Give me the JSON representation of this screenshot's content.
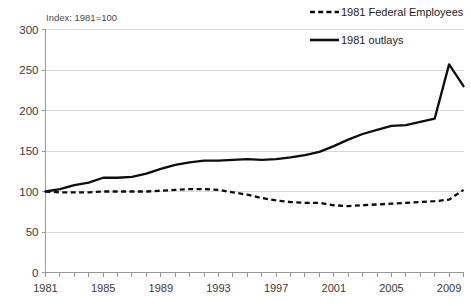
{
  "chart_data": {
    "type": "line",
    "title": "",
    "note": "Index: 1981=100",
    "xlabel": "",
    "ylabel": "",
    "xlim": [
      1981,
      2010
    ],
    "ylim": [
      0,
      300
    ],
    "yticks": [
      0,
      50,
      100,
      150,
      200,
      250,
      300
    ],
    "xticks": [
      1981,
      1982,
      1983,
      1984,
      1985,
      1986,
      1987,
      1988,
      1989,
      1990,
      1991,
      1992,
      1993,
      1994,
      1995,
      1996,
      1997,
      1998,
      1999,
      2000,
      2001,
      2002,
      2003,
      2004,
      2005,
      2006,
      2007,
      2008,
      2009,
      2010
    ],
    "xtick_labels": [
      "1981",
      "",
      "",
      "",
      "1985",
      "",
      "",
      "",
      "1989",
      "",
      "",
      "",
      "1993",
      "",
      "",
      "",
      "1997",
      "",
      "",
      "",
      "2001",
      "",
      "",
      "",
      "2005",
      "",
      "",
      "",
      "2009",
      ""
    ],
    "x": [
      1981,
      1982,
      1983,
      1984,
      1985,
      1986,
      1987,
      1988,
      1989,
      1990,
      1991,
      1992,
      1993,
      1994,
      1995,
      1996,
      1997,
      1998,
      1999,
      2000,
      2001,
      2002,
      2003,
      2004,
      2005,
      2006,
      2007,
      2008,
      2009,
      2010
    ],
    "grid": true,
    "grid_axis": "y",
    "legend_position": "top-right",
    "series": [
      {
        "name": "1981 Federal Employees",
        "style": "dashed",
        "color": "#0d0d0d",
        "values": [
          100,
          99,
          99,
          99,
          100,
          100,
          100,
          100,
          101,
          102,
          103,
          103,
          102,
          99,
          96,
          92,
          89,
          87,
          86,
          86,
          83,
          82,
          83,
          84,
          85,
          86,
          87,
          88,
          90,
          102
        ]
      },
      {
        "name": "1981 outlays",
        "style": "solid",
        "color": "#0d0d0d",
        "values": [
          100,
          103,
          108,
          111,
          117,
          117,
          118,
          122,
          128,
          133,
          136,
          138,
          138,
          139,
          140,
          139,
          140,
          142,
          145,
          149,
          156,
          164,
          171,
          176,
          181,
          182,
          186,
          190,
          257,
          230
        ]
      }
    ]
  },
  "legend": {
    "items": [
      {
        "label": "1981 Federal Employees",
        "style": "dashed"
      },
      {
        "label": "1981 outlays",
        "style": "solid"
      }
    ]
  }
}
